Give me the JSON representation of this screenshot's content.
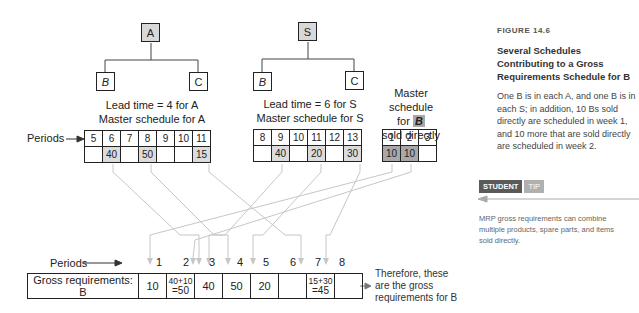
{
  "product_a": {
    "parent": "A",
    "children": [
      "B",
      "C"
    ],
    "lead_time_label": "Lead time = 4 for A",
    "schedule_label": "Master schedule for A",
    "periods": [
      "5",
      "6",
      "7",
      "8",
      "9",
      "10",
      "11"
    ],
    "quantities": [
      "",
      "40",
      "",
      "50",
      "",
      "",
      "15"
    ]
  },
  "product_s": {
    "parent": "S",
    "children": [
      "B",
      "C"
    ],
    "lead_time_label": "Lead time = 6 for S",
    "schedule_label": "Master schedule for S",
    "periods": [
      "8",
      "9",
      "10",
      "11",
      "12",
      "13"
    ],
    "quantities": [
      "",
      "40",
      "",
      "20",
      "",
      "30"
    ]
  },
  "direct_b": {
    "label_line1": "Master schedule",
    "label_line2_prefix": "for",
    "label_item": "B",
    "label_line3": "sold directly",
    "periods": [
      "1",
      "2",
      "3"
    ],
    "quantities": [
      "10",
      "10",
      ""
    ]
  },
  "periods_label": "Periods",
  "gross": {
    "label": "Gross requirements: B",
    "periods": [
      "1",
      "2",
      "3",
      "4",
      "5",
      "6",
      "7",
      "8"
    ],
    "values": [
      {
        "text": "10"
      },
      {
        "top": "40+10",
        "bottom": "=50"
      },
      {
        "text": "40"
      },
      {
        "text": "50"
      },
      {
        "text": "20"
      },
      {
        "text": ""
      },
      {
        "top": "15+30",
        "bottom": "=45"
      },
      {
        "text": ""
      }
    ],
    "note_line1": "Therefore, these",
    "note_line2": "are the gross",
    "note_line3": "requirements for B"
  },
  "sidebar": {
    "figure_label": "FIGURE 14.6",
    "title": "Several Schedules Contributing to a Gross Requirements Schedule for B",
    "body": "One B is in each A, and one B is in each S; in addition, 10 Bs sold directly are scheduled in week 1, and 10 more that are sold directly are scheduled in week 2.",
    "tip_tag_1": "STUDENT",
    "tip_tag_2": "TIP",
    "tip_body": "MRP gross requirements can combine multiple products, spare parts, and items sold directly."
  },
  "colors": {
    "parent_fill": "#d8d8d8",
    "light_cell": "#dcdcdc",
    "dark_cell": "#a8a8a8",
    "connector": "#c8c8c8"
  }
}
